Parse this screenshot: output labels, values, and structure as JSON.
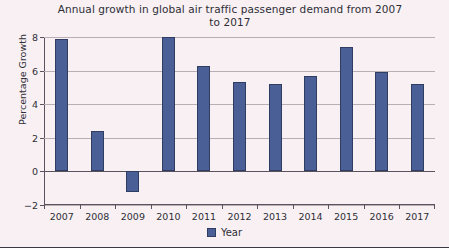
{
  "chart_data": {
    "type": "bar",
    "title": "Annual growth in global air traffic passenger demand from 2007 to 2017",
    "title_line1": "Annual growth in global air traffic passenger demand from 2007",
    "title_line2": "to 2017",
    "xlabel": "",
    "ylabel": "Percentage Growth",
    "categories": [
      "2007",
      "2008",
      "2009",
      "2010",
      "2011",
      "2012",
      "2013",
      "2014",
      "2015",
      "2016",
      "2017"
    ],
    "values": [
      7.9,
      2.4,
      -1.2,
      8.0,
      6.3,
      5.3,
      5.2,
      5.7,
      7.4,
      5.9,
      5.2
    ],
    "series": [
      {
        "name": "Year",
        "values": [
          7.9,
          2.4,
          -1.2,
          8.0,
          6.3,
          5.3,
          5.2,
          5.7,
          7.4,
          5.9,
          5.2
        ]
      }
    ],
    "ylim": [
      -2,
      8
    ],
    "yticks": [
      -2,
      0,
      2,
      4,
      6,
      8
    ],
    "ytick_labels": [
      "−2",
      "0",
      "2",
      "4",
      "6",
      "8"
    ],
    "grid": true,
    "legend_position": "bottom",
    "legend": [
      "Year"
    ],
    "bar_color": "#4a5f96",
    "bar_border_color": "#2f3d63",
    "background_color": "#f8f0f3",
    "gridline_color": "#b9aeb6",
    "axis_color": "#5a525c",
    "text_color": "#2e2e36"
  },
  "legend": {
    "label": "Year"
  }
}
